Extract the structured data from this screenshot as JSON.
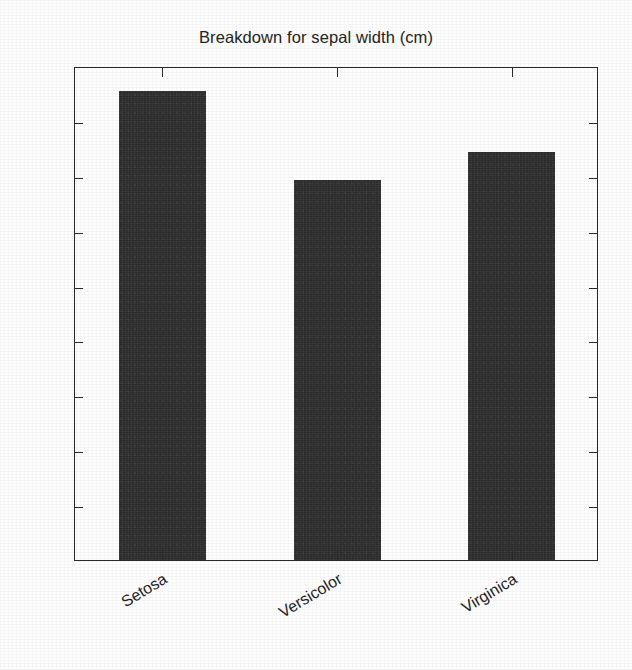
{
  "chart_data": {
    "type": "bar",
    "title": "Breakdown for sepal width (cm)",
    "xlabel": "",
    "ylabel": "",
    "categories": [
      "Setosa",
      "Versicolor",
      "Virginica"
    ],
    "values": [
      171,
      138.5,
      148.5
    ],
    "series": [
      {
        "name": "sepal width (cm)",
        "values": [
          171,
          138.5,
          148.5
        ]
      }
    ],
    "ylim": [
      0,
      180
    ],
    "yticks": [
      0,
      20,
      40,
      60,
      80,
      100,
      120,
      140,
      160,
      180
    ],
    "ytick_labels": [
      "0",
      "20",
      "40",
      "60",
      "80",
      "100",
      "120",
      "140",
      "160",
      "180"
    ],
    "xtick_labels": [
      "Setosa",
      "Versicolor",
      "Virginica"
    ],
    "xtick_rotation_deg": -31,
    "grid": false,
    "legend": null,
    "legend_position": "none",
    "bar_color": "#2c2c2c",
    "axis_color": "#2a2a2a",
    "background_color": "#ffffff",
    "frame": "box-all-sides-inward-ticks"
  }
}
